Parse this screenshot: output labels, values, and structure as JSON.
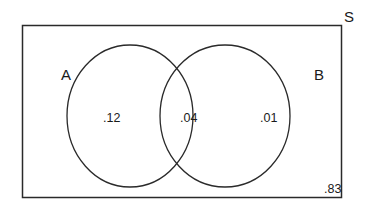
{
  "diagram": {
    "type": "venn",
    "universe": {
      "label": "S",
      "value": ".83"
    },
    "sets": [
      {
        "label": "A",
        "only_value": ".12"
      },
      {
        "label": "B",
        "only_value": ".01"
      }
    ],
    "intersection": {
      "sets": [
        "A",
        "B"
      ],
      "value": ".04"
    },
    "colors": {
      "stroke": "#2a2a2a",
      "background": "#ffffff"
    }
  }
}
